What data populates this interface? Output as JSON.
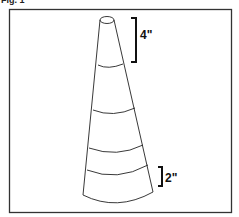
{
  "figure": {
    "label": "Fig. 1",
    "top_dimension": "4\"",
    "bottom_dimension": "2\"",
    "stroke_color": "#222222",
    "background": "#ffffff"
  }
}
